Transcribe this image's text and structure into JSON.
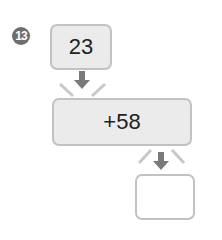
{
  "problem": {
    "number": "13",
    "start_value": "23",
    "operation": "+58",
    "result": "",
    "colors": {
      "badge": "#6e6e6e",
      "box_fill": "#ebebeb",
      "box_border": "#c2c2c2",
      "arrow": "#7a7a7a"
    }
  }
}
